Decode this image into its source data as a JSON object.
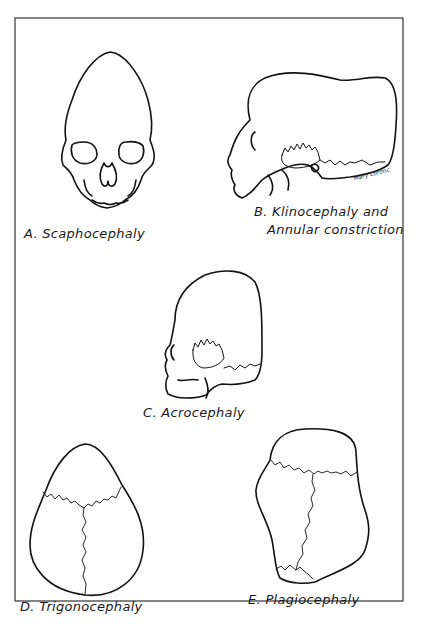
{
  "figure": {
    "panels": [
      {
        "id": "A",
        "label": "A. Scaphocephaly",
        "view": "frontal"
      },
      {
        "id": "B",
        "label_line1": "B. Klinocephaly and",
        "label_line2": "Annular constriction",
        "view": "lateral"
      },
      {
        "id": "C",
        "label": "C. Acrocephaly",
        "view": "lateral"
      },
      {
        "id": "D",
        "label": "D. Trigonocephaly",
        "view": "superior"
      },
      {
        "id": "E",
        "label": "E. Plagiocephaly",
        "view": "superior"
      }
    ],
    "signature": "Mary Lorenc",
    "colors": {
      "ink": "#111111",
      "background": "#ffffff",
      "border": "#333333"
    }
  }
}
